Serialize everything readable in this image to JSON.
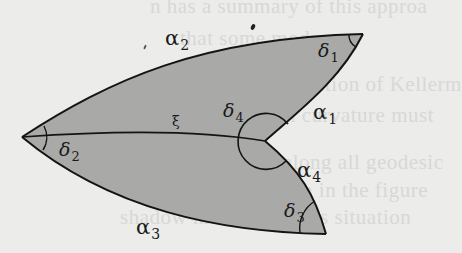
{
  "diagram": {
    "type": "geodesic quadrilateral with reflex vertex (two shaded triangles sharing diagonal)",
    "colors": {
      "background": "#ececea",
      "fill": "#a9a9a7",
      "stroke": "#141414"
    },
    "vertices": {
      "v1": {
        "x": 363,
        "y": 34,
        "angle_label": "δ1"
      },
      "v2": {
        "x": 22,
        "y": 137,
        "angle_label": "δ2"
      },
      "v3": {
        "x": 326,
        "y": 234,
        "angle_label": "δ3"
      },
      "v4": {
        "x": 265,
        "y": 141,
        "angle_label": "δ4",
        "reflex": true
      }
    },
    "edges": [
      {
        "name": "α2",
        "from": "v2",
        "to": "v1"
      },
      {
        "name": "α1",
        "from": "v1",
        "to": "v4"
      },
      {
        "name": "α4",
        "from": "v4",
        "to": "v3"
      },
      {
        "name": "α3",
        "from": "v3",
        "to": "v2"
      },
      {
        "name": "ξ",
        "from": "v2",
        "to": "v4",
        "diagonal": true
      }
    ]
  },
  "labels": {
    "alpha1": {
      "main": "α",
      "sub": "1"
    },
    "alpha2": {
      "main": "α",
      "sub": "2"
    },
    "alpha3": {
      "main": "α",
      "sub": "3"
    },
    "alpha4": {
      "main": "α",
      "sub": "4"
    },
    "delta1": {
      "main": "δ",
      "sub": "1"
    },
    "delta2": {
      "main": "δ",
      "sub": "2"
    },
    "delta3": {
      "main": "δ",
      "sub": "3"
    },
    "delta4": {
      "main": "δ",
      "sub": "4"
    },
    "xi": {
      "main": "ξ"
    }
  },
  "background_bleed": [
    "n has a summary of this approa",
    "that some modern",
    "s a superposition of Kellerm",
    "l which curvature must",
    "cut along all geodesic",
    "is shown in the figure",
    "shadow method for this situation"
  ]
}
